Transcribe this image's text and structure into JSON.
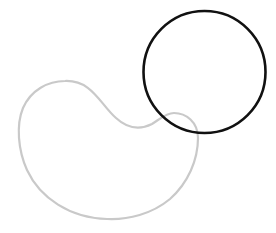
{
  "canvas": {
    "width": 276,
    "height": 233,
    "background": "#ffffff"
  },
  "shapes": {
    "circle": {
      "cx": 204.5,
      "cy": 72,
      "r": 61,
      "stroke": "#111111",
      "stroke_width": 2.6
    },
    "kidney": {
      "d": "M 65 81 C 92 80 100 104 116 118 C 128 129 140 130 152 124 C 160 119 166 113 174 113 C 186 113 198 122 198 138 C 198 160 188 183 170 199 C 152 214 128 220 107 219 C 70 218 40 198 27 170 C 18 150 16 125 23 108 C 31 90 48 81 65 81 Z",
      "stroke": "#c9c9c9",
      "stroke_width": 2.2
    }
  }
}
